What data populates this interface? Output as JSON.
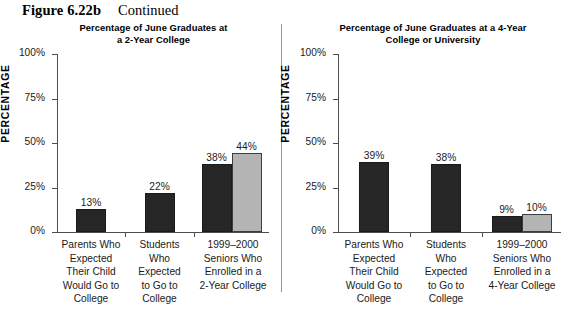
{
  "figure": {
    "number": "Figure 6.22b",
    "status": "Continued"
  },
  "axis_title": "PERCENTAGE",
  "y_ticks": [
    "100%",
    "75%",
    "50%",
    "25%",
    "0%"
  ],
  "panels": [
    {
      "id": "two-year",
      "title_line1": "Percentage of June Graduates at",
      "title_line2": "a 2-Year College",
      "categories": [
        "Parents Who\nExpected\nTheir Child\nWould Go to\nCollege",
        "Students\nWho\nExpected\nto Go to\nCollege",
        "1999–2000\nSeniors Who\nEnrolled in a\n2-Year College"
      ],
      "bars": [
        [
          {
            "value": 13,
            "label": "13%",
            "shade": "dark"
          }
        ],
        [
          {
            "value": 22,
            "label": "22%",
            "shade": "dark"
          }
        ],
        [
          {
            "value": 38,
            "label": "38%",
            "shade": "dark"
          },
          {
            "value": 44,
            "label": "44%",
            "shade": "light"
          }
        ]
      ]
    },
    {
      "id": "four-year",
      "title_line1": "Percentage of June Graduates at a 4-Year",
      "title_line2": "College or University",
      "categories": [
        "Parents Who\nExpected\nTheir Child\nWould Go to\nCollege",
        "Students\nWho\nExpected\nto Go to\nCollege",
        "1999–2000\nSeniors Who\nEnrolled in a\n4-Year College"
      ],
      "bars": [
        [
          {
            "value": 39,
            "label": "39%",
            "shade": "dark"
          }
        ],
        [
          {
            "value": 38,
            "label": "38%",
            "shade": "dark"
          }
        ],
        [
          {
            "value": 9,
            "label": "9%",
            "shade": "dark"
          },
          {
            "value": 10,
            "label": "10%",
            "shade": "light"
          }
        ]
      ]
    }
  ],
  "colors": {
    "bar_dark": "#262626",
    "bar_light": "#b4b4b4",
    "axis": "#4d4d4d",
    "text": "#1a1a1a"
  },
  "chart_data": [
    {
      "type": "bar",
      "title": "Percentage of June Graduates at a 2-Year College",
      "xlabel": "",
      "ylabel": "PERCENTAGE",
      "ylim": [
        0,
        100
      ],
      "ytick_labels": [
        "0%",
        "25%",
        "50%",
        "75%",
        "100%"
      ],
      "grid": false,
      "legend": "none",
      "categories": [
        "Parents Who Expected Their Child Would Go to College",
        "Students Who Expected to Go to College",
        "1999–2000 Seniors Who Enrolled in a 2-Year College"
      ],
      "series": [
        {
          "name": "dark",
          "values": [
            13,
            22,
            38
          ]
        },
        {
          "name": "light",
          "values": [
            null,
            null,
            44
          ]
        }
      ],
      "data_labels": [
        "13%",
        "22%",
        "38%",
        "44%"
      ]
    },
    {
      "type": "bar",
      "title": "Percentage of June Graduates at a 4-Year College or University",
      "xlabel": "",
      "ylabel": "PERCENTAGE",
      "ylim": [
        0,
        100
      ],
      "ytick_labels": [
        "0%",
        "25%",
        "50%",
        "75%",
        "100%"
      ],
      "grid": false,
      "legend": "none",
      "categories": [
        "Parents Who Expected Their Child Would Go to College",
        "Students Who Expected to Go to College",
        "1999–2000 Seniors Who Enrolled in a 4-Year College"
      ],
      "series": [
        {
          "name": "dark",
          "values": [
            39,
            38,
            9
          ]
        },
        {
          "name": "light",
          "values": [
            null,
            null,
            10
          ]
        }
      ],
      "data_labels": [
        "39%",
        "38%",
        "9%",
        "10%"
      ]
    }
  ]
}
